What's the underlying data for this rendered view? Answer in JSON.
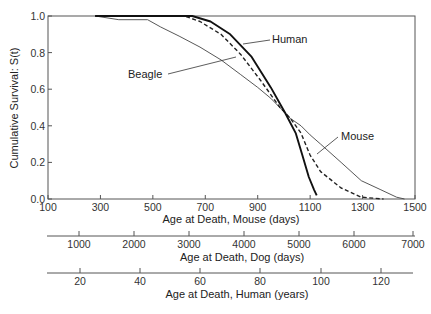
{
  "chart_data": {
    "type": "line",
    "title": "",
    "ylabel": "Cumulative Survival: S(t)",
    "xlabel": "Age at Death, Mouse (days)",
    "xlim": [
      100,
      1500
    ],
    "ylim": [
      0.0,
      1.0
    ],
    "grid": false,
    "legend": "inline annotations",
    "y_ticks": [
      "0.0",
      "0.2",
      "0.4",
      "0.6",
      "0.8",
      "1.0"
    ],
    "x_ticks": [
      "100",
      "300",
      "500",
      "700",
      "900",
      "1100",
      "1300",
      "1500"
    ],
    "secondary_axes": [
      {
        "label": "Age at Death, Dog (days)",
        "ticks": [
          "1000",
          "2000",
          "3000",
          "4000",
          "5000",
          "6000",
          "7000"
        ]
      },
      {
        "label": "Age at Death, Human (years)",
        "ticks": [
          "20",
          "40",
          "60",
          "80",
          "100",
          "120"
        ]
      }
    ],
    "series": [
      {
        "name": "Mouse",
        "style": "thin solid",
        "x": [
          280,
          370,
          480,
          530,
          600,
          680,
          760,
          835,
          900,
          950,
          1025,
          1065,
          1100,
          1140,
          1218,
          1295,
          1370,
          1430,
          1460
        ],
        "y": [
          1.0,
          0.98,
          0.98,
          0.94,
          0.89,
          0.83,
          0.76,
          0.68,
          0.61,
          0.55,
          0.44,
          0.4,
          0.35,
          0.3,
          0.2,
          0.1,
          0.05,
          0.01,
          0.0
        ]
      },
      {
        "name": "Beagle",
        "style": "dashed",
        "x": [
          280,
          620,
          680,
          760,
          835,
          910,
          985,
          1025,
          1065,
          1100,
          1140,
          1218,
          1295,
          1380
        ],
        "y": [
          1.0,
          1.0,
          0.97,
          0.9,
          0.79,
          0.65,
          0.5,
          0.44,
          0.36,
          0.24,
          0.15,
          0.06,
          0.01,
          0.0
        ]
      },
      {
        "name": "Human",
        "style": "thick solid",
        "x": [
          280,
          650,
          720,
          795,
          875,
          950,
          1005,
          1045,
          1070,
          1095,
          1115,
          1125
        ],
        "y": [
          1.0,
          1.0,
          0.97,
          0.9,
          0.78,
          0.61,
          0.47,
          0.36,
          0.24,
          0.12,
          0.05,
          0.02
        ]
      }
    ],
    "annotations": [
      "Human",
      "Beagle",
      "Mouse"
    ]
  },
  "labels": {
    "ylabel": "Cumulative Survival: S(t)",
    "mouse_axis": "Age at Death, Mouse (days)",
    "dog_axis": "Age at Death, Dog (days)",
    "human_axis": "Age at Death, Human (years)",
    "human": "Human",
    "beagle": "Beagle",
    "mouse": "Mouse"
  }
}
